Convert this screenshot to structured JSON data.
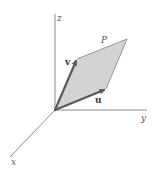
{
  "diagram": {
    "axes": {
      "x_label": "x",
      "y_label": "y",
      "z_label": "z"
    },
    "vectors": {
      "u_label": "u",
      "v_label": "v"
    },
    "region_label": "P",
    "colors": {
      "fill": "#d3d3d3",
      "vector": "#5a5a5a",
      "axis": "#7a7a7a"
    }
  }
}
